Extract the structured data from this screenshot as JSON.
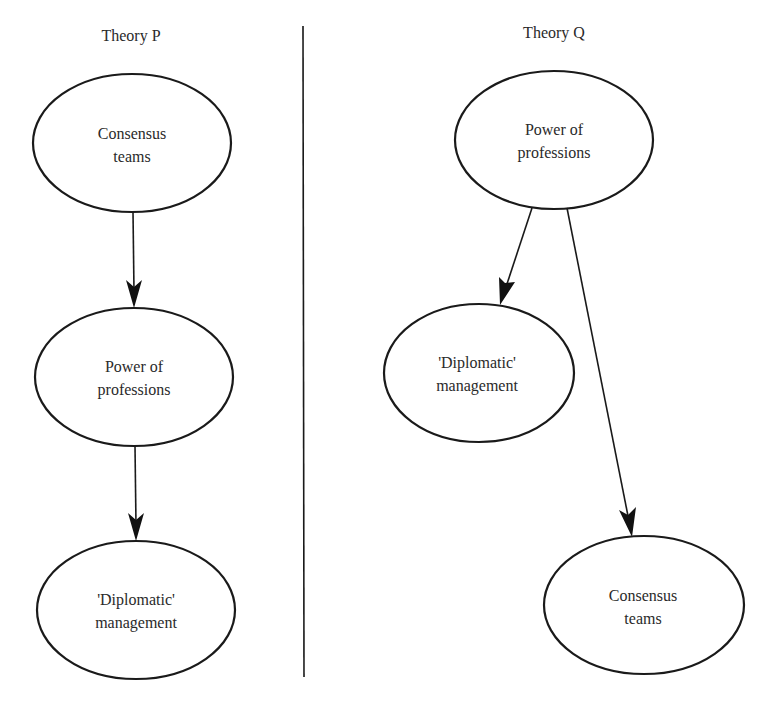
{
  "panels": [
    {
      "title": "Theory P",
      "nodes": [
        {
          "id": "p_consensus",
          "lines": [
            "Consensus",
            "teams"
          ]
        },
        {
          "id": "p_power",
          "lines": [
            "Power of",
            "professions"
          ]
        },
        {
          "id": "p_diplomatic",
          "lines": [
            "'Diplomatic'",
            "management"
          ]
        }
      ],
      "edges": [
        {
          "from": "p_consensus",
          "to": "p_power"
        },
        {
          "from": "p_power",
          "to": "p_diplomatic"
        }
      ]
    },
    {
      "title": "Theory Q",
      "nodes": [
        {
          "id": "q_power",
          "lines": [
            "Power of",
            "professions"
          ]
        },
        {
          "id": "q_diplomatic",
          "lines": [
            "'Diplomatic'",
            "management"
          ]
        },
        {
          "id": "q_consensus",
          "lines": [
            "Consensus",
            "teams"
          ]
        }
      ],
      "edges": [
        {
          "from": "q_power",
          "to": "q_diplomatic"
        },
        {
          "from": "q_power",
          "to": "q_consensus"
        }
      ]
    }
  ],
  "colors": {
    "stroke": "#1a1a1a",
    "text": "#2a2a2a",
    "background": "#ffffff"
  }
}
